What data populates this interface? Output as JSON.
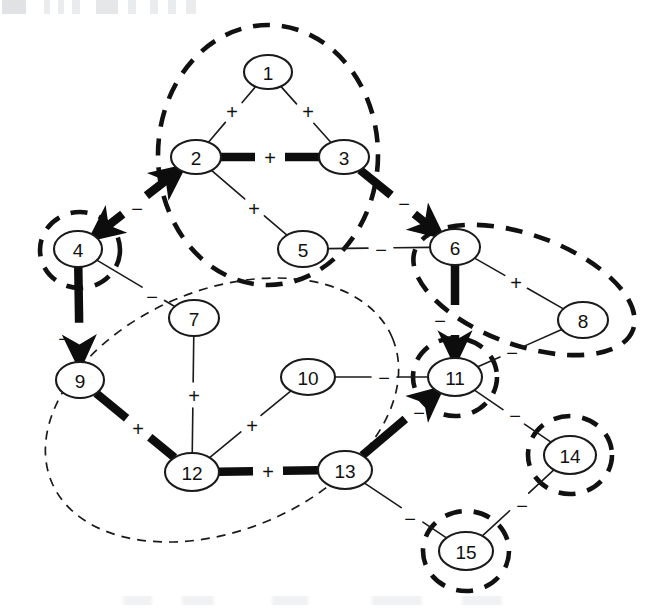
{
  "figure": {
    "kind": "signed-graph-clustering-diagram",
    "canvas": {
      "width": 654,
      "height": 615
    },
    "background_color": "#ffffff",
    "ink_color": "#111111"
  },
  "chart_data": {
    "type": "diagram",
    "title": "",
    "xlabel": "",
    "ylabel": "",
    "nodes": [
      {
        "id": "1",
        "label": "1",
        "cx": 268,
        "cy": 72,
        "rx": 24,
        "ry": 17
      },
      {
        "id": "2",
        "label": "2",
        "cx": 196,
        "cy": 157,
        "rx": 25,
        "ry": 17
      },
      {
        "id": "3",
        "label": "3",
        "cx": 344,
        "cy": 157,
        "rx": 25,
        "ry": 17
      },
      {
        "id": "4",
        "label": "4",
        "cx": 78,
        "cy": 249,
        "rx": 24,
        "ry": 18
      },
      {
        "id": "5",
        "label": "5",
        "cx": 303,
        "cy": 249,
        "rx": 25,
        "ry": 18
      },
      {
        "id": "6",
        "label": "6",
        "cx": 455,
        "cy": 247,
        "rx": 25,
        "ry": 18
      },
      {
        "id": "7",
        "label": "7",
        "cx": 194,
        "cy": 318,
        "rx": 25,
        "ry": 18
      },
      {
        "id": "8",
        "label": "8",
        "cx": 583,
        "cy": 320,
        "rx": 25,
        "ry": 18
      },
      {
        "id": "9",
        "label": "9",
        "cx": 80,
        "cy": 380,
        "rx": 24,
        "ry": 18
      },
      {
        "id": "10",
        "label": "10",
        "cx": 308,
        "cy": 377,
        "rx": 27,
        "ry": 18
      },
      {
        "id": "11",
        "label": "11",
        "cx": 455,
        "cy": 377,
        "rx": 27,
        "ry": 19
      },
      {
        "id": "12",
        "label": "12",
        "cx": 192,
        "cy": 472,
        "rx": 27,
        "ry": 19
      },
      {
        "id": "13",
        "label": "13",
        "cx": 345,
        "cy": 470,
        "rx": 27,
        "ry": 19
      },
      {
        "id": "14",
        "label": "14",
        "cx": 570,
        "cy": 455,
        "rx": 26,
        "ry": 19
      },
      {
        "id": "15",
        "label": "15",
        "cx": 466,
        "cy": 551,
        "rx": 27,
        "ry": 19
      }
    ],
    "edges": [
      {
        "source": "1",
        "target": "2",
        "sign": "+",
        "weight": "weak",
        "arrow": "none",
        "sign_x": 232,
        "sign_y": 111
      },
      {
        "source": "1",
        "target": "3",
        "sign": "+",
        "weight": "weak",
        "arrow": "none",
        "sign_x": 308,
        "sign_y": 111
      },
      {
        "source": "2",
        "target": "3",
        "sign": "+",
        "weight": "strong",
        "arrow": "none",
        "sign_x": 270,
        "sign_y": 157
      },
      {
        "source": "2",
        "target": "4",
        "sign": "-",
        "weight": "strong",
        "arrow": "both",
        "sign_x": 137,
        "sign_y": 208
      },
      {
        "source": "2",
        "target": "5",
        "sign": "+",
        "weight": "weak",
        "arrow": "none",
        "sign_x": 254,
        "sign_y": 208
      },
      {
        "source": "3",
        "target": "6",
        "sign": "-",
        "weight": "strong",
        "arrow": "end",
        "sign_x": 404,
        "sign_y": 203
      },
      {
        "source": "5",
        "target": "6",
        "sign": "-",
        "weight": "weak",
        "arrow": "none",
        "sign_x": 381,
        "sign_y": 249
      },
      {
        "source": "4",
        "target": "7",
        "sign": "-",
        "weight": "weak",
        "arrow": "none",
        "sign_x": 152,
        "sign_y": 296
      },
      {
        "source": "4",
        "target": "9",
        "sign": "-",
        "weight": "strong",
        "arrow": "end",
        "sign_x": 64,
        "sign_y": 338
      },
      {
        "source": "6",
        "target": "8",
        "sign": "+",
        "weight": "weak",
        "arrow": "none",
        "sign_x": 516,
        "sign_y": 282
      },
      {
        "source": "6",
        "target": "11",
        "sign": "-",
        "weight": "strong",
        "arrow": "end",
        "sign_x": 440,
        "sign_y": 320
      },
      {
        "source": "8",
        "target": "11",
        "sign": "-",
        "weight": "weak",
        "arrow": "none",
        "sign_x": 512,
        "sign_y": 352
      },
      {
        "source": "9",
        "target": "12",
        "sign": "+",
        "weight": "strong",
        "arrow": "none",
        "sign_x": 138,
        "sign_y": 428
      },
      {
        "source": "7",
        "target": "12",
        "sign": "+",
        "weight": "weak",
        "arrow": "none",
        "sign_x": 194,
        "sign_y": 395
      },
      {
        "source": "10",
        "target": "12",
        "sign": "+",
        "weight": "weak",
        "arrow": "none",
        "sign_x": 252,
        "sign_y": 425
      },
      {
        "source": "10",
        "target": "11",
        "sign": "-",
        "weight": "weak",
        "arrow": "none",
        "sign_x": 384,
        "sign_y": 377
      },
      {
        "source": "12",
        "target": "13",
        "sign": "+",
        "weight": "strong",
        "arrow": "none",
        "sign_x": 268,
        "sign_y": 471
      },
      {
        "source": "13",
        "target": "11",
        "sign": "-",
        "weight": "strong",
        "arrow": "end",
        "sign_x": 419,
        "sign_y": 412
      },
      {
        "source": "13",
        "target": "15",
        "sign": "-",
        "weight": "weak",
        "arrow": "none",
        "sign_x": 410,
        "sign_y": 518
      },
      {
        "source": "11",
        "target": "14",
        "sign": "-",
        "weight": "weak",
        "arrow": "none",
        "sign_x": 515,
        "sign_y": 415
      },
      {
        "source": "14",
        "target": "15",
        "sign": "-",
        "weight": "weak",
        "arrow": "none",
        "sign_x": 522,
        "sign_y": 505
      }
    ],
    "clusters": [
      {
        "id": "cluster-a",
        "members": [
          "1",
          "2",
          "3",
          "5"
        ],
        "style": "bold-dashed",
        "cx": 268,
        "cy": 155,
        "rx": 110,
        "ry": 130,
        "rotate": 0
      },
      {
        "id": "cluster-b",
        "members": [
          "4"
        ],
        "style": "bold-dashed",
        "cx": 80,
        "cy": 250,
        "rx": 40,
        "ry": 38,
        "rotate": 0
      },
      {
        "id": "cluster-c",
        "members": [
          "6",
          "8"
        ],
        "style": "bold-dashed",
        "cx": 524,
        "cy": 290,
        "rx": 116,
        "ry": 55,
        "rotate": 20
      },
      {
        "id": "cluster-d",
        "members": [
          "11"
        ],
        "style": "bold-dashed",
        "cx": 455,
        "cy": 377,
        "rx": 42,
        "ry": 39,
        "rotate": 0
      },
      {
        "id": "cluster-e",
        "members": [
          "14"
        ],
        "style": "bold-dashed",
        "cx": 570,
        "cy": 455,
        "rx": 42,
        "ry": 39,
        "rotate": 0
      },
      {
        "id": "cluster-f",
        "members": [
          "15"
        ],
        "style": "bold-dashed",
        "cx": 466,
        "cy": 551,
        "rx": 43,
        "ry": 40,
        "rotate": 0
      },
      {
        "id": "cluster-g",
        "members": [
          "9",
          "7",
          "12",
          "13"
        ],
        "style": "thin-dashed",
        "cx": 222,
        "cy": 410,
        "rx": 185,
        "ry": 120,
        "rotate": -23
      }
    ],
    "legend": {
      "visible": false,
      "entries": []
    },
    "signs": {
      "positive": "+",
      "negative": "-"
    }
  }
}
